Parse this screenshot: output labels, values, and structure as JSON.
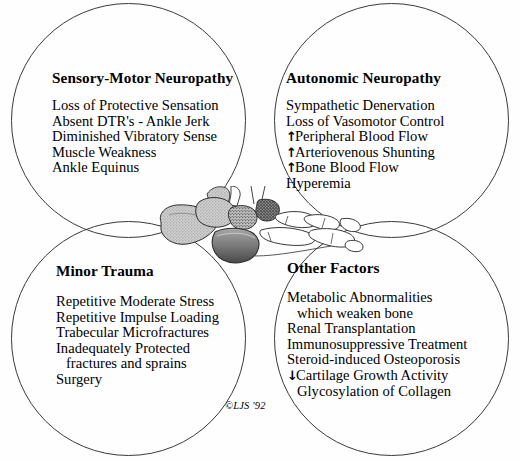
{
  "figure": {
    "copyright": "©LJS '92",
    "line_color": "#3a3a3a"
  },
  "quadrants": [
    {
      "id": "sensory-motor",
      "heading": "Sensory-Motor Neuropathy",
      "items": [
        {
          "text": "Loss of Protective Sensation",
          "marker": "",
          "indent": false
        },
        {
          "text": "Absent DTR's - Ankle Jerk",
          "marker": "",
          "indent": false
        },
        {
          "text": "Diminished Vibratory Sense",
          "marker": "",
          "indent": false
        },
        {
          "text": "Muscle Weakness",
          "marker": "",
          "indent": false
        },
        {
          "text": "Ankle Equinus",
          "marker": "",
          "indent": false
        }
      ]
    },
    {
      "id": "autonomic",
      "heading": "Autonomic Neuropathy",
      "items": [
        {
          "text": "Sympathetic Denervation",
          "marker": "",
          "indent": false
        },
        {
          "text": "Loss of Vasomotor Control",
          "marker": "",
          "indent": false
        },
        {
          "text": "Peripheral Blood Flow",
          "marker": "↑",
          "indent": false
        },
        {
          "text": "Arteriovenous Shunting",
          "marker": "↑",
          "indent": false
        },
        {
          "text": "Bone Blood Flow",
          "marker": "↑",
          "indent": false
        },
        {
          "text": "Hyperemia",
          "marker": "",
          "indent": false
        }
      ]
    },
    {
      "id": "minor-trauma",
      "heading": "Minor Trauma",
      "items": [
        {
          "text": "Repetitive Moderate Stress",
          "marker": "",
          "indent": false
        },
        {
          "text": "Repetitive Impulse Loading",
          "marker": "",
          "indent": false
        },
        {
          "text": "Trabecular Microfractures",
          "marker": "",
          "indent": false
        },
        {
          "text": "Inadequately Protected",
          "marker": "",
          "indent": false
        },
        {
          "text": "fractures and sprains",
          "marker": "",
          "indent": true
        },
        {
          "text": "Surgery",
          "marker": "",
          "indent": false
        }
      ]
    },
    {
      "id": "other-factors",
      "heading": "Other Factors",
      "items": [
        {
          "text": "Metabolic Abnormalities",
          "marker": "",
          "indent": false
        },
        {
          "text": "which weaken bone",
          "marker": "",
          "indent": true
        },
        {
          "text": "Renal Transplantation",
          "marker": "",
          "indent": false
        },
        {
          "text": "Immunosuppressive Treatment",
          "marker": "",
          "indent": false
        },
        {
          "text": "Steroid-induced Osteoporosis",
          "marker": "",
          "indent": false
        },
        {
          "text": "Cartilage Growth Activity",
          "marker": "↓",
          "indent": false
        },
        {
          "text": "Glycosylation of Collagen",
          "marker": "",
          "indent": true
        }
      ]
    }
  ]
}
